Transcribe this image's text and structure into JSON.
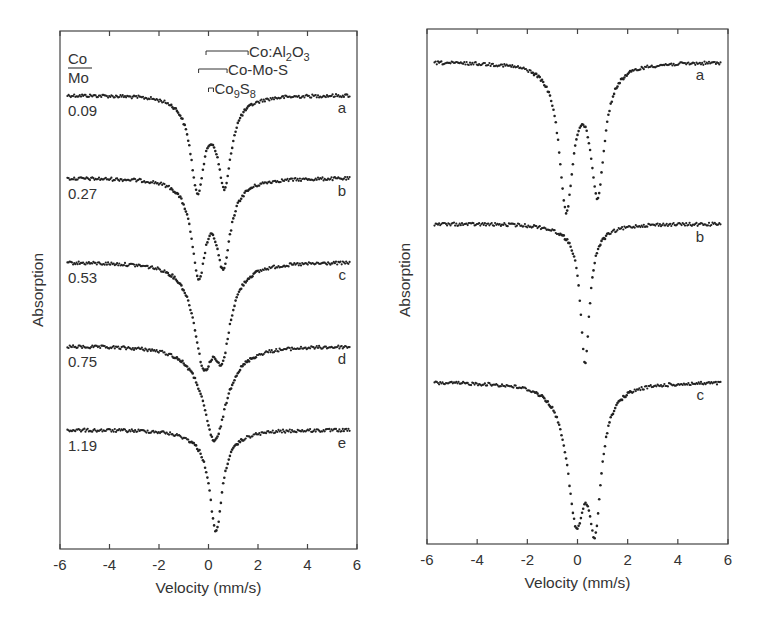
{
  "chart_data": [
    {
      "type": "scatter",
      "panel": "left",
      "title": "",
      "xlabel": "Velocity (mm/s)",
      "ylabel": "Absorption",
      "xlim": [
        -6,
        6
      ],
      "xticks": [
        -6,
        -4,
        -2,
        0,
        2,
        4,
        6
      ],
      "grid": false,
      "legend_header": {
        "numerator": "Co",
        "denominator": "Mo"
      },
      "annotations": [
        {
          "label": "Co:Al",
          "sub1": "2",
          "mid": "O",
          "sub2": "3",
          "x_from": -0.1,
          "x_to": 1.6,
          "y_px": 51
        },
        {
          "label": "Co-Mo-S",
          "x_from": -0.4,
          "x_to": 0.75,
          "y_px": 69
        },
        {
          "label": "Co",
          "sub1": "9",
          "mid": "S",
          "sub2": "8",
          "x_from": 0.0,
          "x_to": 0.2,
          "y_px": 88
        }
      ],
      "series": [
        {
          "name": "a",
          "ratio": "0.09",
          "baseline_px": 95,
          "lines": [
            {
              "center": -0.45,
              "depth": 88,
              "width": 0.32
            },
            {
              "center": 0.65,
              "depth": 82,
              "width": 0.32
            }
          ],
          "wing": 0.9
        },
        {
          "name": "b",
          "ratio": "0.27",
          "baseline_px": 178,
          "lines": [
            {
              "center": -0.4,
              "depth": 90,
              "width": 0.33
            },
            {
              "center": 0.6,
              "depth": 78,
              "width": 0.33
            }
          ],
          "wing": 0.9
        },
        {
          "name": "c",
          "ratio": "0.53",
          "baseline_px": 262,
          "lines": [
            {
              "center": -0.2,
              "depth": 86,
              "width": 0.45
            },
            {
              "center": 0.55,
              "depth": 74,
              "width": 0.4
            }
          ],
          "wing": 0.9
        },
        {
          "name": "d",
          "ratio": "0.75",
          "baseline_px": 346,
          "lines": [
            {
              "center": 0.25,
              "depth": 89,
              "width": 0.55
            }
          ],
          "wing": 0.9
        },
        {
          "name": "e",
          "ratio": "1.19",
          "baseline_px": 430,
          "lines": [
            {
              "center": 0.3,
              "depth": 96,
              "width": 0.3
            }
          ],
          "wing": 0.9
        }
      ]
    },
    {
      "type": "scatter",
      "panel": "right",
      "title": "",
      "xlabel": "Velocity (mm/s)",
      "ylabel": "Absorption",
      "xlim": [
        -6,
        6
      ],
      "xticks": [
        -6,
        -4,
        -2,
        0,
        2,
        4,
        6
      ],
      "grid": false,
      "series": [
        {
          "name": "a",
          "baseline_px": 62,
          "lines": [
            {
              "center": -0.45,
              "depth": 138,
              "width": 0.33
            },
            {
              "center": 0.8,
              "depth": 122,
              "width": 0.33
            }
          ],
          "wing": 1.0
        },
        {
          "name": "b",
          "baseline_px": 224,
          "lines": [
            {
              "center": 0.3,
              "depth": 133,
              "width": 0.22
            }
          ],
          "wing": 1.0
        },
        {
          "name": "c",
          "baseline_px": 382,
          "lines": [
            {
              "center": -0.05,
              "depth": 124,
              "width": 0.42
            },
            {
              "center": 0.7,
              "depth": 120,
              "width": 0.3
            }
          ],
          "wing": 1.0
        }
      ]
    }
  ],
  "panels": {
    "left": {
      "x0": 60,
      "x1": 357,
      "y0": 31,
      "y1": 549,
      "ylabel_x": 43,
      "ylabel_y": 290,
      "letter_x": 346
    },
    "right": {
      "x0": 427,
      "x1": 728,
      "y0": 29,
      "y1": 544,
      "ylabel_x": 410,
      "ylabel_y": 280,
      "letter_x": 704
    }
  },
  "colors": {
    "ink": "#222222",
    "axis": "#444444",
    "text": "#333333",
    "background": "#ffffff"
  }
}
